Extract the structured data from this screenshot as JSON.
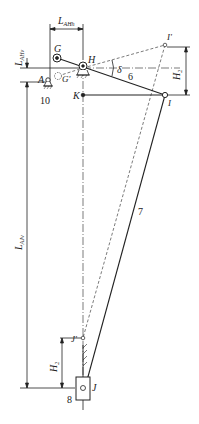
{
  "diagram": {
    "type": "mechanism linkage schematic",
    "points": {
      "G": "G",
      "G_prime": "G'",
      "H": "H",
      "A": "A",
      "K": "K",
      "I": "I",
      "I_prime": "I'",
      "J": "J",
      "J_prime": "J'"
    },
    "dimensions": {
      "L_AH_horizontal": {
        "main": "L",
        "sub": "AHh"
      },
      "L_AH_vertical": {
        "main": "L",
        "sub": "AHv"
      },
      "L_AJ": {
        "main": "L",
        "sub": "AJv"
      },
      "H2_top": {
        "main": "H",
        "sub": "2"
      },
      "H2_bottom": {
        "main": "H",
        "sub": "2"
      },
      "angle": "δ"
    },
    "part_numbers": {
      "link_HI": "6",
      "link_IJ": "7",
      "slider_J": "8",
      "support_A": "10"
    },
    "colors": {
      "line": "#222222",
      "background": "#ffffff"
    }
  }
}
